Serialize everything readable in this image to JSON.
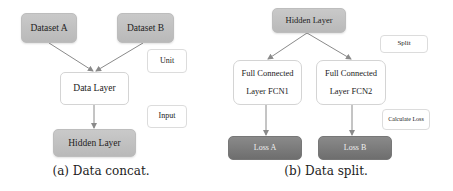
{
  "diagram_a": {
    "caption": "(a) Data concat.",
    "nodes": {
      "dataset_a": "Dataset A",
      "dataset_b": "Dataset B",
      "data_layer": "Data Layer",
      "hidden_layer": "Hidden Layer"
    },
    "legend": {
      "unit": "Unit",
      "input": "Input"
    },
    "edges": [
      {
        "from": "Dataset A",
        "to": "Data Layer"
      },
      {
        "from": "Dataset B",
        "to": "Data Layer"
      },
      {
        "from": "Data Layer",
        "to": "Hidden Layer"
      }
    ]
  },
  "diagram_b": {
    "caption": "(b) Data split.",
    "nodes": {
      "hidden_layer": "Hidden Layer",
      "fcn1_line1": "Full Connected",
      "fcn1_line2": "Layer FCN1",
      "fcn2_line1": "Full Connected",
      "fcn2_line2": "Layer FCN2",
      "loss_a": "Loss A",
      "loss_b": "Loss B"
    },
    "legend": {
      "split": "Split",
      "calculate_loss": "Calculate Loss"
    },
    "edges": [
      {
        "from": "Hidden Layer",
        "to": "Full Connected Layer FCN1"
      },
      {
        "from": "Hidden Layer",
        "to": "Full Connected Layer FCN2"
      },
      {
        "from": "Full Connected Layer FCN1",
        "to": "Loss A"
      },
      {
        "from": "Full Connected Layer FCN2",
        "to": "Loss B"
      }
    ]
  },
  "colors": {
    "node_gray": "#c2c2c2",
    "node_dark": "#7a7a7a",
    "edge": "#8a8a8a",
    "border_light": "#d4d4d4"
  }
}
